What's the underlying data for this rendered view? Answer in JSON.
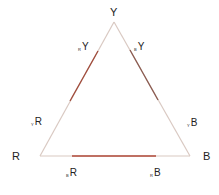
{
  "diagram": {
    "vertices": {
      "top": "Y",
      "left": "R",
      "right": "B"
    },
    "edge_labels": {
      "left_upper": {
        "sub": "R",
        "main": "Y"
      },
      "right_upper": {
        "sub": "B",
        "main": "Y"
      },
      "left_lower": {
        "sub": "Y",
        "main": "R"
      },
      "right_lower": {
        "sub": "Y",
        "main": "B"
      },
      "bottom_left": {
        "sub": "B",
        "main": "R"
      },
      "bottom_right": {
        "sub": "R",
        "main": "B"
      }
    },
    "colors": {
      "line_light": "#d8c8c0",
      "line_accent": "#b04030",
      "text": "#222222"
    }
  }
}
